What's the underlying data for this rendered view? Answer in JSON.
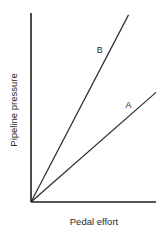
{
  "chart_data": {
    "type": "line",
    "title": "",
    "xlabel": "Pedal effort",
    "ylabel": "Pipeline pressure",
    "xlim": [
      0,
      1
    ],
    "ylim": [
      0,
      1
    ],
    "grid": false,
    "ticks": false,
    "legend": "inline labels",
    "series": [
      {
        "name": "A",
        "x": [
          0,
          1.0
        ],
        "y": [
          0,
          0.58
        ],
        "label_at": [
          0.78,
          0.5
        ]
      },
      {
        "name": "B",
        "x": [
          0,
          0.78
        ],
        "y": [
          0,
          0.99
        ],
        "label_at": [
          0.55,
          0.79
        ]
      }
    ]
  },
  "colors": {
    "axis": "#1e1e1e",
    "line": "#2a2a2a",
    "background": "#ffffff"
  }
}
